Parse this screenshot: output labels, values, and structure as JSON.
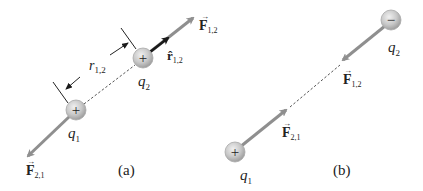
{
  "figure": {
    "panel_a": {
      "label": "(a)",
      "q1": {
        "name": "q",
        "sub": "1",
        "sign": "+"
      },
      "q2": {
        "name": "q",
        "sub": "2",
        "sign": "+"
      },
      "distance": {
        "name": "r",
        "sub": "1,2"
      },
      "unit_vector": {
        "name": "r̂",
        "sub": "1,2"
      },
      "force_on_2": {
        "name": "F",
        "sub": "1,2"
      },
      "force_on_1": {
        "name": "F",
        "sub": "2,1"
      }
    },
    "panel_b": {
      "label": "(b)",
      "q1": {
        "name": "q",
        "sub": "1",
        "sign": "+"
      },
      "q2": {
        "name": "q",
        "sub": "2",
        "sign": "−"
      },
      "force_on_2": {
        "name": "F",
        "sub": "1,2"
      },
      "force_on_1": {
        "name": "F",
        "sub": "2,1"
      }
    },
    "colors": {
      "force_arrow": "#8f8f8f",
      "unit_arrow": "#1a1a1a",
      "sphere_fill": "#c8c8c8",
      "sphere_edge": "#a8a8a8",
      "text": "#222222"
    }
  }
}
